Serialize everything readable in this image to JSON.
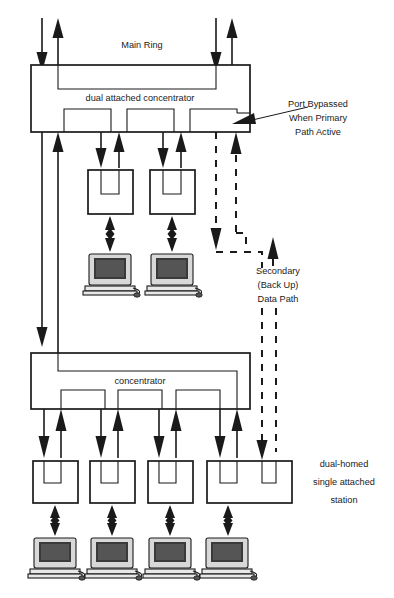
{
  "diagram": {
    "title_label": "Main Ring",
    "type": "fddi-network-topology",
    "nodes": {
      "dual_attached_concentrator": {
        "label": "dual attached concentrator",
        "box": {
          "x": 31,
          "y": 65,
          "w": 219,
          "h": 67
        }
      },
      "concentrator": {
        "label": "concentrator",
        "box": {
          "x": 31,
          "y": 353,
          "w": 219,
          "h": 56
        }
      }
    },
    "annotations": [
      {
        "name": "port-bypassed-note",
        "lines": [
          "Port Bypassed",
          "When Primary",
          "Path Active"
        ],
        "x": 318,
        "y": 118
      },
      {
        "name": "secondary-path-note",
        "lines": [
          "Secondary",
          "(Back Up)",
          "Data Path"
        ],
        "x": 278,
        "y": 282
      },
      {
        "name": "dual-homed-note",
        "lines": [
          "dual-homed",
          "single attached",
          "station"
        ],
        "x": 344,
        "y": 477
      }
    ],
    "upper_stations": [
      {
        "name": "upper-station-1",
        "x": 88,
        "y": 170,
        "w": 45,
        "h": 44
      },
      {
        "name": "upper-station-2",
        "x": 150,
        "y": 170,
        "w": 45,
        "h": 44
      }
    ],
    "lower_stations": [
      {
        "name": "lower-station-1",
        "x": 33,
        "y": 461,
        "w": 45,
        "h": 42,
        "dual_homed": false
      },
      {
        "name": "lower-station-2",
        "x": 90,
        "y": 461,
        "w": 45,
        "h": 42,
        "dual_homed": false
      },
      {
        "name": "lower-station-3",
        "x": 148,
        "y": 461,
        "w": 45,
        "h": 42,
        "dual_homed": false
      },
      {
        "name": "lower-station-4",
        "x": 207,
        "y": 461,
        "w": 85,
        "h": 42,
        "dual_homed": true
      }
    ],
    "computers": [
      {
        "name": "computer-upper-1",
        "x": 89,
        "y": 254
      },
      {
        "name": "computer-upper-2",
        "x": 151,
        "y": 254
      },
      {
        "name": "computer-lower-1",
        "x": 34,
        "y": 538
      },
      {
        "name": "computer-lower-2",
        "x": 91,
        "y": 538
      },
      {
        "name": "computer-lower-3",
        "x": 149,
        "y": 538
      },
      {
        "name": "computer-lower-4",
        "x": 206,
        "y": 538
      }
    ],
    "colors": {
      "line": "#1a1a1a",
      "background": "#ffffff",
      "screen": "#3a3a3a"
    },
    "legend": {
      "primary_path": "solid",
      "secondary_path": "dashed"
    }
  }
}
